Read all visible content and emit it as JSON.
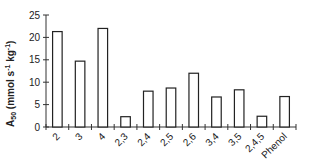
{
  "chart_data": {
    "type": "bar",
    "title": "",
    "xlabel": "",
    "ylabel": "A50 (mmol s-1 kg-1)",
    "ylabel_parts": {
      "main": "A",
      "sub": "50",
      "rest": " (mmol s",
      "sup1": "-1",
      "mid": " kg",
      "sup2": "-1",
      "end": ")"
    },
    "ylim": [
      0,
      25
    ],
    "yticks": [
      0,
      5,
      10,
      15,
      20,
      25
    ],
    "grid": false,
    "legend": "none",
    "categories": [
      "2",
      "3",
      "4",
      "2,3",
      "2,4",
      "2,5",
      "2,6",
      "3,4",
      "3,5",
      "2,4,5",
      "Phenol"
    ],
    "values": [
      21.3,
      14.7,
      22.0,
      2.3,
      8.0,
      8.7,
      12.0,
      6.7,
      8.3,
      2.4,
      6.8
    ],
    "bar_fill": "#ffffff",
    "bar_stroke": "#222222"
  }
}
